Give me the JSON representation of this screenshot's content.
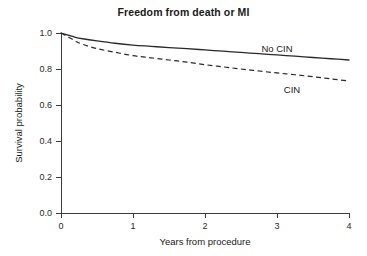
{
  "chart_data": {
    "type": "line",
    "title": "Freedom from death or MI",
    "xlabel": "Years from procedure",
    "ylabel": "Survival probability",
    "xlim": [
      0,
      4
    ],
    "ylim": [
      0,
      1
    ],
    "xticks": [
      "0",
      "1",
      "2",
      "3",
      "4"
    ],
    "xtick_values": [
      0,
      1,
      2,
      3,
      4
    ],
    "yticks": [
      "0.0",
      "0.2",
      "0.4",
      "0.6",
      "0.8",
      "1.0"
    ],
    "ytick_values": [
      0.0,
      0.2,
      0.4,
      0.6,
      0.8,
      1.0
    ],
    "grid": false,
    "legend_position": "inline-labels",
    "x": [
      0,
      0.1,
      0.2,
      0.3,
      0.5,
      0.75,
      1.0,
      1.25,
      1.5,
      1.75,
      2.0,
      2.25,
      2.5,
      2.75,
      3.0,
      3.25,
      3.5,
      3.75,
      4.0
    ],
    "series": [
      {
        "name": "No CIN",
        "style": "solid",
        "color": "#2a2a2a",
        "label": "No CIN",
        "values": [
          1.0,
          0.988,
          0.976,
          0.968,
          0.956,
          0.943,
          0.933,
          0.926,
          0.919,
          0.913,
          0.906,
          0.899,
          0.892,
          0.885,
          0.878,
          0.871,
          0.864,
          0.857,
          0.85
        ]
      },
      {
        "name": "CIN",
        "style": "dashed",
        "color": "#2a2a2a",
        "label": "CIN",
        "values": [
          1.0,
          0.978,
          0.955,
          0.937,
          0.913,
          0.893,
          0.874,
          0.862,
          0.85,
          0.838,
          0.824,
          0.812,
          0.8,
          0.789,
          0.778,
          0.768,
          0.757,
          0.745,
          0.733
        ]
      }
    ],
    "annotations": [
      {
        "text": "No CIN",
        "x_px": 277,
        "y_px": 52
      },
      {
        "text": "CIN",
        "x_px": 292,
        "y_px": 93
      }
    ]
  }
}
